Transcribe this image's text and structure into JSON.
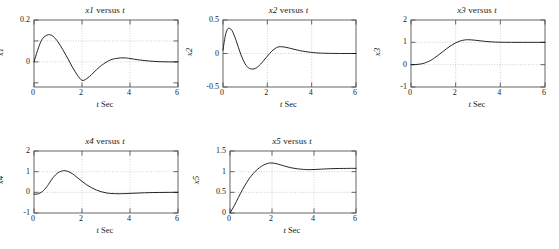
{
  "figure": {
    "background": "#ffffff",
    "line_color": "#000000",
    "frame_color": "#555555",
    "grid_color": "#bbbbbb",
    "width": 559,
    "height": 249
  },
  "panels": [
    {
      "id": "x1",
      "title_var": "x1",
      "title_mid": " versus ",
      "title_t": "t",
      "ylabel": "x1",
      "xlabel_t": "t",
      "xlabel_rest": " Sec",
      "box": {
        "left": 33,
        "top": 19,
        "width": 144,
        "height": 67
      },
      "yticks": [
        {
          "value": 0.2,
          "label": "0.2"
        },
        {
          "value": 0.1,
          "label": ""
        },
        {
          "value": 0.0,
          "label": "0"
        },
        {
          "value": -0.1,
          "label": ""
        }
      ],
      "xticks": [
        {
          "value": 0,
          "label": "0"
        },
        {
          "value": 2,
          "label": "2"
        },
        {
          "value": 4,
          "label": "4"
        },
        {
          "value": 6,
          "label": "6"
        }
      ],
      "xlim": [
        0,
        6
      ],
      "ylim": [
        -0.12,
        0.2
      ],
      "gridlines_y": [
        0.1,
        0.0
      ],
      "gridlines_x": [
        2,
        4
      ]
    },
    {
      "id": "x2",
      "title_var": "x2",
      "title_mid": " versus ",
      "title_t": "t",
      "ylabel": "x2",
      "xlabel_t": "t",
      "xlabel_rest": " Sec",
      "box": {
        "left": 222,
        "top": 19,
        "width": 133,
        "height": 67
      },
      "yticks": [
        {
          "value": 0.5,
          "label": "0.5"
        },
        {
          "value": 0.0,
          "label": "0"
        },
        {
          "value": -0.5,
          "label": "-0.5"
        }
      ],
      "xticks": [
        {
          "value": 0,
          "label": "0"
        },
        {
          "value": 2,
          "label": "2"
        },
        {
          "value": 4,
          "label": "4"
        },
        {
          "value": 6,
          "label": "6"
        }
      ],
      "xlim": [
        0,
        6
      ],
      "ylim": [
        -0.5,
        0.5
      ],
      "gridlines_y": [
        0.0
      ],
      "gridlines_x": [
        2,
        4
      ]
    },
    {
      "id": "x3",
      "title_var": "x3",
      "title_mid": " versus ",
      "title_t": "t",
      "ylabel": "x3",
      "xlabel_t": "t",
      "xlabel_rest": " Sec",
      "box": {
        "left": 410,
        "top": 19,
        "width": 134,
        "height": 67
      },
      "yticks": [
        {
          "value": 2,
          "label": "2"
        },
        {
          "value": 1,
          "label": "1"
        },
        {
          "value": 0,
          "label": "0"
        },
        {
          "value": -1,
          "label": "-1"
        }
      ],
      "xticks": [
        {
          "value": 0,
          "label": "0"
        },
        {
          "value": 2,
          "label": "2"
        },
        {
          "value": 4,
          "label": "4"
        },
        {
          "value": 6,
          "label": "6"
        }
      ],
      "xlim": [
        0,
        6
      ],
      "ylim": [
        -1,
        2
      ],
      "gridlines_y": [
        1,
        0
      ],
      "gridlines_x": [
        2,
        4
      ]
    },
    {
      "id": "x4",
      "title_var": "x4",
      "title_mid": " versus ",
      "title_t": "t",
      "ylabel": "x4",
      "xlabel_t": "t",
      "xlabel_rest": " Sec",
      "box": {
        "left": 33,
        "top": 150,
        "width": 144,
        "height": 62
      },
      "yticks": [
        {
          "value": 2,
          "label": "2"
        },
        {
          "value": 1,
          "label": "1"
        },
        {
          "value": 0,
          "label": "0"
        },
        {
          "value": -1,
          "label": "-1"
        }
      ],
      "xticks": [
        {
          "value": 0,
          "label": "0"
        },
        {
          "value": 2,
          "label": "2"
        },
        {
          "value": 4,
          "label": "4"
        },
        {
          "value": 6,
          "label": "6"
        }
      ],
      "xlim": [
        0,
        6
      ],
      "ylim": [
        -1,
        2
      ],
      "gridlines_y": [
        1,
        0
      ],
      "gridlines_x": [
        2,
        4
      ]
    },
    {
      "id": "x5",
      "title_var": "x5",
      "title_mid": " versus ",
      "title_t": "t",
      "ylabel": "x5",
      "xlabel_t": "t",
      "xlabel_rest": " Sec",
      "box": {
        "left": 229,
        "top": 150,
        "width": 126,
        "height": 62
      },
      "yticks": [
        {
          "value": 1.5,
          "label": "1.5"
        },
        {
          "value": 1.0,
          "label": "1"
        },
        {
          "value": 0.5,
          "label": "0.5"
        },
        {
          "value": 0.0,
          "label": "0"
        }
      ],
      "xticks": [
        {
          "value": 0,
          "label": "0"
        },
        {
          "value": 2,
          "label": "2"
        },
        {
          "value": 4,
          "label": "4"
        },
        {
          "value": 6,
          "label": "6"
        }
      ],
      "xlim": [
        0,
        6
      ],
      "ylim": [
        0,
        1.5
      ],
      "gridlines_y": [
        1.0,
        0.5
      ],
      "gridlines_x": [
        2,
        4
      ]
    }
  ],
  "chart_data": [
    {
      "type": "line",
      "title": "x1 versus t",
      "xlabel": "t Sec",
      "ylabel": "x1",
      "xlim": [
        0,
        6
      ],
      "ylim": [
        -0.12,
        0.2
      ],
      "grid": true,
      "legend": null,
      "x": [
        0,
        0.15,
        0.3,
        0.45,
        0.6,
        0.65,
        0.8,
        1.0,
        1.2,
        1.4,
        1.6,
        1.8,
        2.0,
        2.2,
        2.4,
        2.6,
        2.8,
        3.0,
        3.2,
        3.4,
        3.6,
        3.8,
        4.0,
        4.4,
        4.8,
        5.2,
        5.6,
        6.0
      ],
      "y": [
        0.0,
        0.055,
        0.1,
        0.122,
        0.13,
        0.13,
        0.122,
        0.095,
        0.058,
        0.018,
        -0.025,
        -0.062,
        -0.088,
        -0.08,
        -0.06,
        -0.038,
        -0.018,
        -0.002,
        0.01,
        0.016,
        0.019,
        0.019,
        0.016,
        0.009,
        0.004,
        0.001,
        0.0,
        0.0
      ]
    },
    {
      "type": "line",
      "title": "x2 versus t",
      "xlabel": "t Sec",
      "ylabel": "x2",
      "xlim": [
        0,
        6
      ],
      "ylim": [
        -0.5,
        0.5
      ],
      "grid": true,
      "legend": null,
      "x": [
        0,
        0.1,
        0.2,
        0.3,
        0.4,
        0.5,
        0.6,
        0.7,
        0.8,
        0.9,
        1.0,
        1.1,
        1.2,
        1.4,
        1.6,
        1.8,
        2.0,
        2.2,
        2.4,
        2.5,
        2.7,
        3.0,
        3.3,
        3.6,
        4.0,
        4.4,
        5.0,
        5.5,
        6.0
      ],
      "y": [
        0.05,
        0.26,
        0.36,
        0.375,
        0.345,
        0.275,
        0.185,
        0.085,
        -0.01,
        -0.09,
        -0.155,
        -0.2,
        -0.225,
        -0.23,
        -0.19,
        -0.12,
        -0.04,
        0.035,
        0.085,
        0.098,
        0.1,
        0.08,
        0.055,
        0.035,
        0.016,
        0.006,
        0.001,
        0.0,
        0.0
      ]
    },
    {
      "type": "line",
      "title": "x3 versus t",
      "xlabel": "t Sec",
      "ylabel": "x3",
      "xlim": [
        0,
        6
      ],
      "ylim": [
        -1,
        2
      ],
      "grid": true,
      "legend": null,
      "x": [
        0,
        0.2,
        0.4,
        0.6,
        0.8,
        1.0,
        1.2,
        1.4,
        1.6,
        1.8,
        2.0,
        2.2,
        2.4,
        2.5,
        2.7,
        3.0,
        3.3,
        3.6,
        4.0,
        4.5,
        5.0,
        5.5,
        6.0
      ],
      "y": [
        0.0,
        0.005,
        0.025,
        0.07,
        0.15,
        0.265,
        0.41,
        0.565,
        0.72,
        0.86,
        0.975,
        1.06,
        1.105,
        1.115,
        1.11,
        1.08,
        1.045,
        1.02,
        1.005,
        1.0,
        1.0,
        1.0,
        1.0
      ]
    },
    {
      "type": "line",
      "title": "x4 versus t",
      "xlabel": "t Sec",
      "ylabel": "x4",
      "xlim": [
        0,
        6
      ],
      "ylim": [
        -1,
        2
      ],
      "grid": true,
      "legend": null,
      "x": [
        0,
        0.1,
        0.2,
        0.3,
        0.4,
        0.5,
        0.6,
        0.8,
        1.0,
        1.2,
        1.25,
        1.4,
        1.6,
        1.8,
        2.0,
        2.2,
        2.4,
        2.6,
        2.8,
        3.0,
        3.2,
        3.5,
        3.8,
        4.2,
        4.6,
        5.0,
        5.5,
        6.0
      ],
      "y": [
        -0.08,
        -0.09,
        -0.06,
        0.0,
        0.09,
        0.22,
        0.38,
        0.72,
        0.95,
        1.045,
        1.05,
        1.02,
        0.9,
        0.72,
        0.53,
        0.36,
        0.22,
        0.11,
        0.03,
        -0.025,
        -0.055,
        -0.068,
        -0.06,
        -0.04,
        -0.022,
        -0.01,
        -0.003,
        0.0
      ]
    },
    {
      "type": "line",
      "title": "x5 versus t",
      "xlabel": "t Sec",
      "ylabel": "x5",
      "xlim": [
        0,
        1.5
      ],
      "ylim": [
        0,
        1.5
      ],
      "grid": true,
      "legend": null,
      "x": [
        0,
        0.2,
        0.4,
        0.6,
        0.8,
        1.0,
        1.2,
        1.4,
        1.6,
        1.8,
        1.9,
        2.1,
        2.3,
        2.6,
        2.9,
        3.2,
        3.5,
        3.7,
        4.0,
        4.3,
        4.6,
        5.0,
        5.4,
        5.7,
        6.0
      ],
      "y": [
        0.0,
        0.175,
        0.375,
        0.57,
        0.745,
        0.89,
        1.005,
        1.095,
        1.16,
        1.2,
        1.21,
        1.205,
        1.18,
        1.135,
        1.095,
        1.07,
        1.055,
        1.05,
        1.052,
        1.06,
        1.068,
        1.075,
        1.078,
        1.08,
        1.08
      ]
    }
  ]
}
